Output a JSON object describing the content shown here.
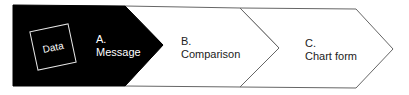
{
  "diagram": {
    "data_box": {
      "label": "Data"
    },
    "steps": [
      {
        "letter": "A.",
        "label": "Message",
        "fill": "#000000"
      },
      {
        "letter": "B.",
        "label": "Comparison",
        "fill": "#ffffff"
      },
      {
        "letter": "C.",
        "label": "Chart form",
        "fill": "#ffffff"
      }
    ],
    "colors": {
      "stroke": "#555555",
      "dark": "#000000"
    }
  }
}
